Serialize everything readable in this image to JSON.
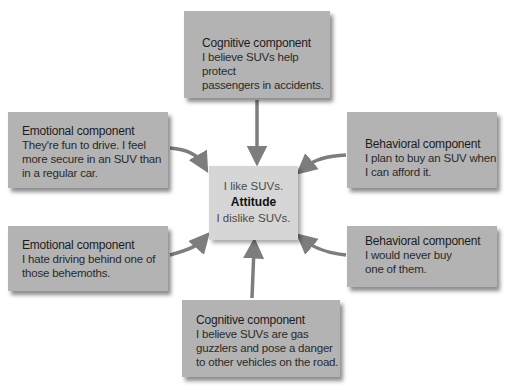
{
  "center": {
    "top_text": "I like SUVs.",
    "label": "Attitude",
    "bottom_text": "I dislike SUVs."
  },
  "components": [
    {
      "id": "top",
      "title": "Cognitive component",
      "lines": [
        "I believe SUVs help protect",
        "passengers in accidents."
      ]
    },
    {
      "id": "left-upper",
      "title": "Emotional component",
      "lines": [
        "They're fun to drive. I feel",
        "more secure in an SUV than",
        "in a regular car."
      ]
    },
    {
      "id": "right-upper",
      "title": "Behavioral component",
      "lines": [
        "I plan to buy an SUV when",
        "I can afford it."
      ]
    },
    {
      "id": "left-lower",
      "title": "Emotional component",
      "lines": [
        "I hate driving behind one of",
        "those behemoths."
      ]
    },
    {
      "id": "right-lower",
      "title": "Behavioral component",
      "lines": [
        "I would never buy",
        "one of them."
      ]
    },
    {
      "id": "bottom",
      "title": "Cognitive component",
      "lines": [
        "I believe SUVs are gas",
        "guzzlers and pose a danger",
        "to other vehicles on the road."
      ]
    }
  ],
  "colors": {
    "box": "#b3b3b3",
    "center": "#d6d6d6",
    "arrow": "#7d7d7d"
  }
}
